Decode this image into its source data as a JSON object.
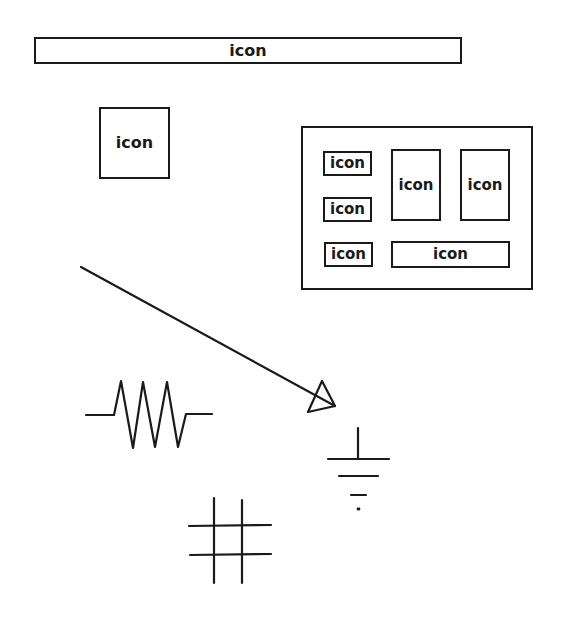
{
  "colors": {
    "ink": "#1a1a1a",
    "background": "#ffffff"
  },
  "top_bar": {
    "label": "icon"
  },
  "single_icon": {
    "label": "icon"
  },
  "panel": {
    "small_1": {
      "label": "icon"
    },
    "small_2": {
      "label": "icon"
    },
    "small_3": {
      "label": "icon"
    },
    "tall_1": {
      "label": "icon"
    },
    "tall_2": {
      "label": "icon"
    },
    "wide": {
      "label": "icon"
    }
  },
  "symbols": [
    "arrow",
    "resistor",
    "ground",
    "grid"
  ]
}
